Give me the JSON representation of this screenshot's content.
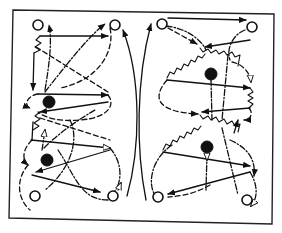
{
  "diagram": {
    "colors": {
      "ink": "#111111",
      "background": "#ffffff"
    },
    "legend": {
      "hollow_circle": "player",
      "solid_circle": "player with ball",
      "solid_arrow": "pass / cut",
      "dashed_arrow": "movement",
      "dash_dot_arrow": "pass path",
      "zigzag_line": "dribble"
    },
    "frame": {
      "top_left": [
        13,
        10
      ],
      "top_right": [
        274,
        14
      ],
      "bottom_right": [
        272,
        224
      ],
      "bottom_left": [
        9,
        218
      ]
    },
    "left_half": {
      "hollow_players": [
        [
          38,
          25
        ],
        [
          115,
          25
        ],
        [
          35,
          196
        ],
        [
          113,
          196
        ]
      ],
      "ball_players": [
        [
          49,
          102
        ],
        [
          47,
          160
        ]
      ]
    },
    "right_half": {
      "hollow_players": [
        [
          162,
          24
        ],
        [
          252,
          27
        ],
        [
          158,
          197
        ],
        [
          247,
          200
        ]
      ],
      "ball_players": [
        [
          211,
          74
        ],
        [
          207,
          147
        ]
      ]
    },
    "center_divider_arcs": 2
  }
}
